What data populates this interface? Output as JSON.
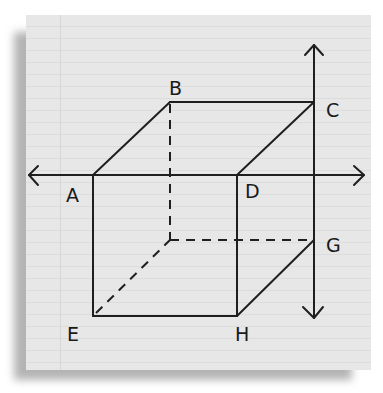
{
  "diagram": {
    "type": "cube-with-axes",
    "background": "lined notebook paper",
    "colors": {
      "paper": "#e7e7e7",
      "ink": "#1f1f1f",
      "ruled_line": "#dcdcdc"
    },
    "vertices": {
      "A": {
        "label": "A",
        "x": 93,
        "y": 175
      },
      "B": {
        "label": "B",
        "x": 170,
        "y": 102
      },
      "C": {
        "label": "C",
        "x": 314,
        "y": 102
      },
      "D": {
        "label": "D",
        "x": 237,
        "y": 175
      },
      "E": {
        "label": "E",
        "x": 93,
        "y": 316
      },
      "F": {
        "label": "",
        "x": 170,
        "y": 240
      },
      "G": {
        "label": "G",
        "x": 314,
        "y": 240
      },
      "H": {
        "label": "H",
        "x": 237,
        "y": 316
      }
    },
    "solid_edges": [
      "A-B",
      "B-C",
      "A-D",
      "C-D",
      "A-E",
      "E-H",
      "D-H",
      "H-G",
      "C-G"
    ],
    "hidden_edges": [
      "B-F",
      "F-G",
      "E-F"
    ],
    "axes": [
      {
        "name": "horizontal-axis",
        "through": [
          "A",
          "D"
        ],
        "arrows": "both"
      },
      {
        "name": "vertical-axis",
        "through": [
          "C",
          "G"
        ],
        "arrows": "both"
      }
    ]
  },
  "labels": {
    "A": "A",
    "B": "B",
    "C": "C",
    "D": "D",
    "E": "E",
    "G": "G",
    "H": "H"
  }
}
